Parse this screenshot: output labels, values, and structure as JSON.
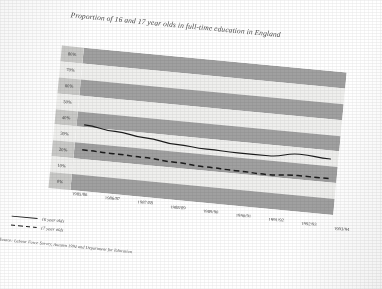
{
  "chart_data": {
    "type": "line",
    "title": "Proportion of 16 and 17 year olds in full-time education in England",
    "xlabel": "",
    "ylabel": "",
    "ylim": [
      0,
      80
    ],
    "ytick_labels": [
      "80%",
      "70%",
      "60%",
      "50%",
      "40%",
      "30%",
      "20%",
      "10%",
      "0%"
    ],
    "ytick_values": [
      80,
      70,
      60,
      50,
      40,
      30,
      20,
      10,
      0
    ],
    "grid": "horizontal-banded",
    "legend_position": "below-left",
    "categories": [
      "1985/86",
      "1986/87",
      "1987/88",
      "1988/89",
      "1989/90",
      "1990/91",
      "1991/92",
      "1992/93",
      "1993/94"
    ],
    "series": [
      {
        "name": "16 year olds",
        "style": "solid",
        "color": "#1c1c1c",
        "values": [
          37,
          35,
          33,
          31,
          30,
          29.5,
          29.5,
          32,
          31
        ]
      },
      {
        "name": "17 year olds",
        "style": "dashed",
        "color": "#1c1c1c",
        "values": [
          23,
          22.5,
          22,
          21,
          20,
          19.5,
          19,
          20,
          20
        ]
      }
    ],
    "source": "Source: Labour Force Survey, Autumn 1994 and Department for Education",
    "colors": {
      "band_dark": "#a0a0a0",
      "band_light": "#efefed",
      "axis_label_bg_dark": "#c9c9c7",
      "line": "#1c1c1c",
      "page": "#ffffff"
    }
  }
}
